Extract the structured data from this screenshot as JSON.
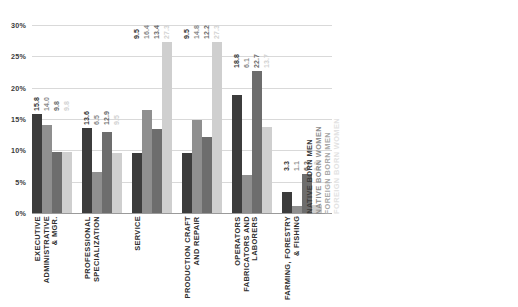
{
  "chart_data": {
    "type": "bar",
    "title": "",
    "xlabel": "",
    "ylabel": "",
    "ylim": [
      0,
      30
    ],
    "ytick_labels": [
      "0%",
      "5%",
      "10%",
      "15%",
      "20%",
      "25%",
      "30%"
    ],
    "ytick_values": [
      0,
      5,
      10,
      15,
      20,
      25,
      30
    ],
    "grid": true,
    "legend_position": "right",
    "categories": [
      "EXECUTIVE\nADMINISTRATIVE\n& MGR.",
      "PROFESSIONAL\nSPECIALIZATION",
      "SERVICE",
      "PRODUCTION CRAFT\nAND REPAIR",
      "OPERATORS\nFABRICATORS AND\nLABORERS",
      "FARMING, FORESTRY\n& FISHING"
    ],
    "series": [
      {
        "name": "NATIVE BORN MEN",
        "color": "#3c3c3c",
        "values": [
          15.8,
          13.6,
          9.5,
          9.5,
          18.8,
          3.3
        ],
        "labels": [
          "15.8",
          "13.6",
          "9.5",
          "9.5",
          "18.8",
          "3.3"
        ]
      },
      {
        "name": "NATIVE BORN WOMEN",
        "color": "#8f8f8f",
        "values": [
          14.0,
          6.5,
          16.4,
          14.8,
          6.1,
          1.1
        ],
        "labels": [
          "14.0",
          "6.5",
          "16.4",
          "14.8",
          "6.1",
          "1.1"
        ]
      },
      {
        "name": "FOREIGN BORN MEN",
        "color": "#6d6d6d",
        "values": [
          9.8,
          12.9,
          13.4,
          12.2,
          22.7,
          6.3
        ],
        "labels": [
          "9.8",
          "12.9",
          "13.4",
          "12.2",
          "22.7",
          "6.3"
        ]
      },
      {
        "name": "FOREIGN BORN WOMEN",
        "color": "#cfcfcf",
        "values": [
          9.8,
          9.5,
          27.3,
          27.3,
          13.7,
          1.3
        ],
        "labels": [
          "9.8",
          "9.5",
          "27.3",
          "27.3",
          "13.7",
          "1.3"
        ]
      }
    ]
  }
}
